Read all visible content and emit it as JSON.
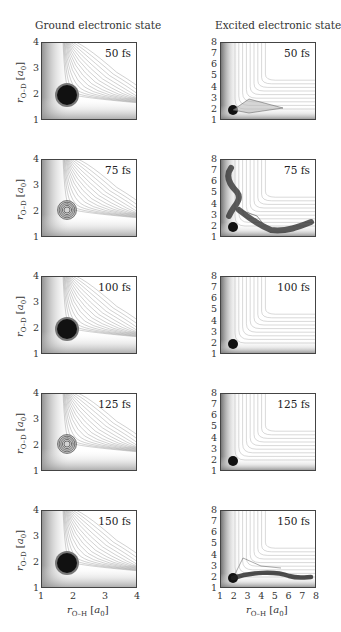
{
  "figure": {
    "left_column_title": "Ground electronic state",
    "right_column_title": "Excited electronic state",
    "x_axis_label": "r",
    "x_axis_label_sub": "O–H",
    "x_axis_unit": "[a",
    "x_axis_unit_sub": "0",
    "x_axis_unit_close": "]",
    "y_axis_label": "r",
    "y_axis_label_sub": "O–D",
    "y_axis_unit": "[a",
    "y_axis_unit_sub": "0",
    "y_axis_unit_close": "]",
    "left_ticks": [
      "1",
      "2",
      "3",
      "4"
    ],
    "right_ticks": [
      "1",
      "2",
      "3",
      "4",
      "5",
      "6",
      "7",
      "8"
    ],
    "times": [
      "50 fs",
      "75 fs",
      "100 fs",
      "125 fs",
      "150 fs"
    ]
  },
  "chart_data": [
    {
      "type": "heatmap",
      "title": "Ground electronic state, 50 fs",
      "xlabel": "r_O-H [a0]",
      "ylabel": "r_O-D [a0]",
      "xlim": [
        1,
        4
      ],
      "ylim": [
        1,
        4
      ],
      "annotation": "50 fs",
      "wavepacket_center": [
        1.8,
        1.8
      ],
      "description": "compact dense wavepacket near equilibrium on potential contours"
    },
    {
      "type": "heatmap",
      "title": "Ground electronic state, 75 fs",
      "xlabel": "r_O-H [a0]",
      "ylabel": "r_O-D [a0]",
      "xlim": [
        1,
        4
      ],
      "ylim": [
        1,
        4
      ],
      "annotation": "75 fs",
      "wavepacket_center": [
        1.8,
        1.9
      ],
      "description": "depleted, ring-shaped wavepacket"
    },
    {
      "type": "heatmap",
      "title": "Ground electronic state, 100 fs",
      "xlabel": "r_O-H [a0]",
      "ylabel": "r_O-D [a0]",
      "xlim": [
        1,
        4
      ],
      "ylim": [
        1,
        4
      ],
      "annotation": "100 fs",
      "wavepacket_center": [
        1.85,
        1.95
      ],
      "description": "dense wavepacket"
    },
    {
      "type": "heatmap",
      "title": "Ground electronic state, 125 fs",
      "xlabel": "r_O-H [a0]",
      "ylabel": "r_O-D [a0]",
      "xlim": [
        1,
        4
      ],
      "ylim": [
        1,
        4
      ],
      "annotation": "125 fs",
      "wavepacket_center": [
        1.8,
        1.95
      ],
      "description": "depleted, ring-shaped wavepacket"
    },
    {
      "type": "heatmap",
      "title": "Ground electronic state, 150 fs",
      "xlabel": "r_O-H [a0]",
      "ylabel": "r_O-D [a0]",
      "xlim": [
        1,
        4
      ],
      "ylim": [
        1,
        4
      ],
      "annotation": "150 fs",
      "wavepacket_center": [
        1.8,
        1.85
      ],
      "description": "dense wavepacket"
    },
    {
      "type": "heatmap",
      "title": "Excited electronic state, 50 fs",
      "xlabel": "r_O-H [a0]",
      "ylabel": "r_O-D [a0]",
      "xlim": [
        1,
        8
      ],
      "ylim": [
        1,
        8
      ],
      "annotation": "50 fs",
      "wavepacket_center": [
        1.8,
        1.7
      ],
      "description": "wavepacket beginning to spread along O-H channel"
    },
    {
      "type": "heatmap",
      "title": "Excited electronic state, 75 fs",
      "xlabel": "r_O-H [a0]",
      "ylabel": "r_O-D [a0]",
      "xlim": [
        1,
        8
      ],
      "ylim": [
        1,
        8
      ],
      "annotation": "75 fs",
      "wavepacket_center": [
        1.8,
        1.8
      ],
      "description": "wavepacket split into O-D channel (up to ~7.5) and O-H channel (up to ~7.5)"
    },
    {
      "type": "heatmap",
      "title": "Excited electronic state, 100 fs",
      "xlabel": "r_O-H [a0]",
      "ylabel": "r_O-D [a0]",
      "xlim": [
        1,
        8
      ],
      "ylim": [
        1,
        8
      ],
      "annotation": "100 fs",
      "wavepacket_center": [
        1.8,
        1.8
      ],
      "description": "small localized wavepacket near origin"
    },
    {
      "type": "heatmap",
      "title": "Excited electronic state, 125 fs",
      "xlabel": "r_O-H [a0]",
      "ylabel": "r_O-D [a0]",
      "xlim": [
        1,
        8
      ],
      "ylim": [
        1,
        8
      ],
      "annotation": "125 fs",
      "wavepacket_center": [
        1.8,
        1.8
      ],
      "description": "small localized wavepacket near origin"
    },
    {
      "type": "heatmap",
      "title": "Excited electronic state, 150 fs",
      "xlabel": "r_O-H [a0]",
      "ylabel": "r_O-D [a0]",
      "xlim": [
        1,
        8
      ],
      "ylim": [
        1,
        8
      ],
      "annotation": "150 fs",
      "wavepacket_center": [
        1.8,
        1.8
      ],
      "description": "wavepacket elongated along O-H channel up to ~7.5"
    }
  ]
}
